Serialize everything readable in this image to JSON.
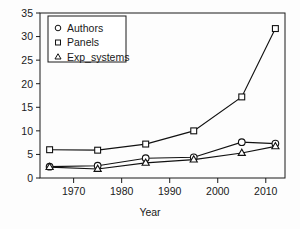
{
  "chart_data": {
    "type": "line",
    "title": "",
    "xlabel": "Year",
    "ylabel": "",
    "xlim": [
      1963,
      2014
    ],
    "ylim": [
      0,
      35
    ],
    "grid": false,
    "legend_position": "upper-left-inside",
    "x": [
      1965,
      1975,
      1985,
      1995,
      2005,
      2012
    ],
    "xticks": [
      1970,
      1980,
      1990,
      2000,
      2010
    ],
    "xtick_labels": [
      "1970",
      "1980",
      "1990",
      "2000",
      "2010"
    ],
    "yticks": [
      0,
      5,
      10,
      15,
      20,
      25,
      30,
      35
    ],
    "ytick_labels": [
      "0",
      "5",
      "10",
      "15",
      "20",
      "25",
      "30",
      "35"
    ],
    "series": [
      {
        "name": "Authors",
        "marker": "circle",
        "values": [
          2.4,
          2.6,
          4.2,
          4.4,
          7.6,
          7.3
        ]
      },
      {
        "name": "Panels",
        "marker": "square",
        "values": [
          6.0,
          5.9,
          7.2,
          10.0,
          17.2,
          31.7
        ]
      },
      {
        "name": "Exp_systems",
        "marker": "triangle",
        "values": [
          2.3,
          1.9,
          3.2,
          3.9,
          5.3,
          6.7
        ]
      }
    ]
  },
  "legend": {
    "entries": [
      {
        "label": "Authors",
        "marker": "circle"
      },
      {
        "label": "Panels",
        "marker": "square"
      },
      {
        "label": "Exp_systems",
        "marker": "triangle"
      }
    ]
  },
  "colors": {
    "line": "#111111",
    "axis": "#1a1a1a",
    "background": "#fdfdfd",
    "marker_fill": "#ffffff"
  }
}
